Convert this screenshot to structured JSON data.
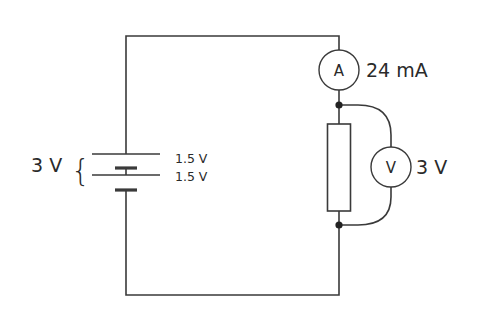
{
  "diagram": {
    "type": "circuit",
    "components": {
      "battery": {
        "total_label": "3 V",
        "cells": [
          {
            "label": "1.5 V"
          },
          {
            "label": "1.5 V"
          }
        ],
        "brace": "{"
      },
      "ammeter": {
        "symbol": "A",
        "reading": "24 mA"
      },
      "voltmeter": {
        "symbol": "V",
        "reading": "3 V"
      },
      "resistor": {
        "label": ""
      }
    },
    "colors": {
      "line": "#3a3a3a",
      "text": "#2a2a2a",
      "background": "#ffffff"
    }
  }
}
